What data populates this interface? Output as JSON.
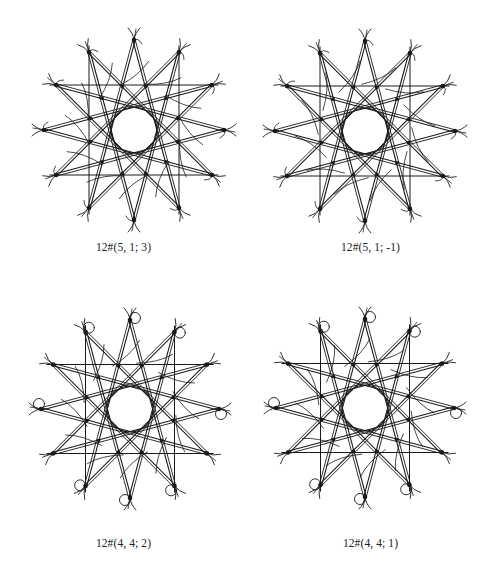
{
  "figure": {
    "stroke_color": "#1a1a1a",
    "background": "#ffffff",
    "panels": [
      {
        "label": "12#(5, 1; 3)",
        "center": [
          134,
          130
        ],
        "outer_radius": 90,
        "inner_circle_radius": 23,
        "star_step": 5,
        "vertex_decoration": "tails",
        "wiggle_phase": 3
      },
      {
        "label": "12#(5, 1; -1)",
        "center": [
          365,
          131
        ],
        "outer_radius": 90,
        "inner_circle_radius": 23,
        "star_step": 5,
        "vertex_decoration": "tails",
        "wiggle_phase": -1
      },
      {
        "label": "12#(4, 4; 2)",
        "center": [
          130,
          409
        ],
        "outer_radius": 89,
        "inner_circle_radius": 23,
        "star_step": 5,
        "vertex_decoration": "loops",
        "wiggle_phase": 2
      },
      {
        "label": "12#(4, 4; 1)",
        "center": [
          365,
          408
        ],
        "outer_radius": 89,
        "inner_circle_radius": 23,
        "star_step": 5,
        "vertex_decoration": "loops",
        "wiggle_phase": 1
      }
    ]
  }
}
